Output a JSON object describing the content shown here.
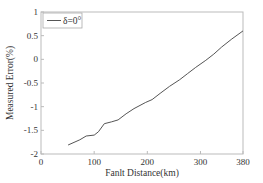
{
  "chart_data": {
    "type": "line",
    "title": "",
    "xlabel": "Fanlt Distance(km)",
    "ylabel": "Measured Error(%)",
    "xlim": [
      0,
      380
    ],
    "ylim": [
      -2,
      1
    ],
    "xticks": [
      0,
      100,
      200,
      300,
      380
    ],
    "yticks": [
      -2,
      -1.5,
      -1,
      -0.5,
      0,
      0.5,
      1
    ],
    "xtick_labels": [
      "0",
      "100",
      "200",
      "300",
      "380"
    ],
    "ytick_labels": [
      "-2",
      "-1.5",
      "-1",
      "-0.5",
      "0",
      "0.5",
      "1"
    ],
    "grid": false,
    "legend_position": "upper left",
    "series": [
      {
        "name": "δ=0°",
        "color": "#555555",
        "x": [
          51,
          73,
          85,
          100,
          108,
          119,
          133,
          145,
          160,
          175,
          197,
          209,
          224,
          242,
          261,
          276,
          291,
          310,
          325,
          340,
          359,
          380
        ],
        "y": [
          -1.81,
          -1.7,
          -1.62,
          -1.6,
          -1.53,
          -1.36,
          -1.32,
          -1.28,
          -1.15,
          -1.04,
          -0.91,
          -0.85,
          -0.72,
          -0.57,
          -0.43,
          -0.3,
          -0.17,
          -0.02,
          0.11,
          0.26,
          0.43,
          0.6
        ]
      }
    ]
  }
}
